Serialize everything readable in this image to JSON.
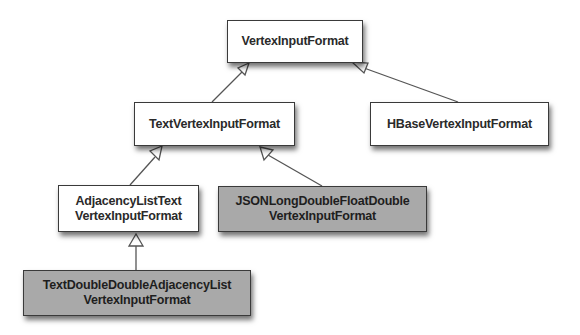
{
  "diagram": {
    "type": "class-hierarchy",
    "nodes": [
      {
        "id": "vertex_input_format",
        "lines": [
          "VertexInputFormat"
        ],
        "shaded": false
      },
      {
        "id": "text_vertex_input_format",
        "lines": [
          "TextVertexInputFormat"
        ],
        "shaded": false
      },
      {
        "id": "hbase_vertex_input_format",
        "lines": [
          "HBaseVertexInputFormat"
        ],
        "shaded": false
      },
      {
        "id": "adjacency_list_text_vertex_input_format",
        "lines": [
          "AdjacencyListText",
          "VertexInputFormat"
        ],
        "shaded": false
      },
      {
        "id": "json_long_double_float_double_vertex_input_format",
        "lines": [
          "JSONLongDoubleFloatDouble",
          "VertexInputFormat"
        ],
        "shaded": true
      },
      {
        "id": "text_double_double_adjacency_list_vertex_input_format",
        "lines": [
          "TextDoubleDoubleAdjacencyList",
          "VertexInputFormat"
        ],
        "shaded": true
      }
    ],
    "edges": [
      {
        "from": "text_vertex_input_format",
        "to": "vertex_input_format",
        "kind": "inheritance"
      },
      {
        "from": "hbase_vertex_input_format",
        "to": "vertex_input_format",
        "kind": "inheritance"
      },
      {
        "from": "adjacency_list_text_vertex_input_format",
        "to": "text_vertex_input_format",
        "kind": "inheritance"
      },
      {
        "from": "json_long_double_float_double_vertex_input_format",
        "to": "text_vertex_input_format",
        "kind": "inheritance"
      },
      {
        "from": "text_double_double_adjacency_list_vertex_input_format",
        "to": "adjacency_list_text_vertex_input_format",
        "kind": "inheritance"
      }
    ],
    "colors": {
      "box_fill": "#ffffff",
      "shaded_fill": "#a9a9a9",
      "border": "#3a3a3a",
      "edge": "#555555"
    }
  }
}
